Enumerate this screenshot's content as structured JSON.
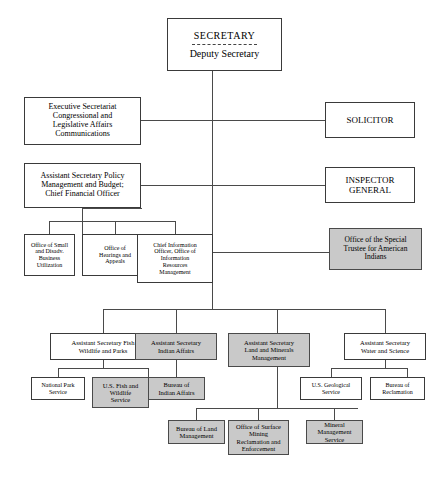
{
  "chart_title": "U.S. Department of the Interior Organization Chart",
  "colors": {
    "shaded_fill": "#c9c9c9",
    "plain_fill": "#ffffff",
    "border": "#3a3a3a",
    "line": "#4a4a4a"
  },
  "nodes": {
    "secretary": {
      "title": "SECRETARY",
      "subtitle": "Deputy Secretary",
      "shaded": false
    },
    "executive_secretariat": {
      "label": "Executive Secretariat Congressional and Legislative Affairs Communications",
      "lines": [
        "Executive Secretariat",
        "Congressional and",
        "Legislative Affairs",
        "Communications"
      ],
      "shaded": false
    },
    "solicitor": {
      "label": "SOLICITOR",
      "lines": [
        "SOLICITOR"
      ],
      "shaded": false
    },
    "asst_sec_policy": {
      "label": "Assistant Secretary Policy Management and Budget; Chief Financial Officer",
      "lines": [
        "Assistant Secretary Policy",
        "Management and Budget;",
        "Chief Financial Officer"
      ],
      "shaded": false
    },
    "inspector_general": {
      "label": "INSPECTOR GENERAL",
      "lines": [
        "INSPECTOR",
        "GENERAL"
      ],
      "shaded": false
    },
    "office_small_disadv": {
      "label": "Office of Small and Disadv. Business Utilization",
      "lines": [
        "Office of Small",
        "and Disadv.",
        "Business",
        "Utilization"
      ],
      "shaded": false
    },
    "office_hearings_appeals": {
      "label": "Office of Hearings and Appeals",
      "lines": [
        "Office of",
        "Hearings and",
        "Appeals"
      ],
      "shaded": false
    },
    "chief_information_officer": {
      "label": "Chief Information Officer, Office of Information Resources Management",
      "lines": [
        "Chief Information",
        "Officer, Office of",
        "Information",
        "Resources",
        "Management"
      ],
      "shaded": false
    },
    "office_special_trustee": {
      "label": "Office of the Special Trustee for American Indians",
      "lines": [
        "Office of the Special",
        "Trustee for American",
        "Indians"
      ],
      "shaded": true
    },
    "asst_sec_fish_wildlife_parks": {
      "label": "Assistant Secretary Fish Wildlife and Parks",
      "lines": [
        "Assistant Secretary Fish",
        "Wildlife and Parks"
      ],
      "shaded": false
    },
    "asst_sec_indian_affairs": {
      "label": "Assistant Secretary Indian Affairs",
      "lines": [
        "Assistant Secretary",
        "Indian Affairs"
      ],
      "shaded": true
    },
    "asst_sec_land_minerals": {
      "label": "Assistant Secretary Land and Minerals Management",
      "lines": [
        "Assistant Secretary",
        "Land and Minerals",
        "Management"
      ],
      "shaded": true
    },
    "asst_sec_water_science": {
      "label": "Assistant Secretary Water and Science",
      "lines": [
        "Assistant Secretary",
        "Water and Science"
      ],
      "shaded": false
    },
    "national_park_service": {
      "label": "National Park Service",
      "lines": [
        "National Park",
        "Service"
      ],
      "shaded": false
    },
    "us_fish_wildlife_service": {
      "label": "U.S. Fish and Wildlife Service",
      "lines": [
        "U.S. Fish and",
        "Wildlife",
        "Service"
      ],
      "shaded": true
    },
    "bureau_indian_affairs": {
      "label": "Bureau of Indian Affairs",
      "lines": [
        "Bureau of",
        "Indian Affairs"
      ],
      "shaded": true
    },
    "us_geological_service": {
      "label": "U.S. Geological Service",
      "lines": [
        "U.S. Geological",
        "Service"
      ],
      "shaded": false
    },
    "bureau_reclamation": {
      "label": "Bureau of Reclamation",
      "lines": [
        "Bureau of",
        "Reclamation"
      ],
      "shaded": false
    },
    "bureau_land_management": {
      "label": "Bureau of Land Management",
      "lines": [
        "Bureau of Land",
        "Management"
      ],
      "shaded": true
    },
    "office_surface_mining": {
      "label": "Office of Surface Mining Reclamation and Enforcement",
      "lines": [
        "Office of Surface",
        "Mining",
        "Reclamation and",
        "Enforcement"
      ],
      "shaded": true
    },
    "mineral_management_service": {
      "label": "Mineral Management Service",
      "lines": [
        "Mineral",
        "Management Service"
      ],
      "shaded": true
    }
  }
}
